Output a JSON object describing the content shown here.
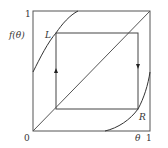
{
  "diagram": {
    "axis_labels": {
      "y_top": "1",
      "y_func": "f(θ)",
      "origin": "0",
      "x_theta": "θ",
      "x_right": "1"
    },
    "points": {
      "L": "L",
      "R": "R"
    },
    "colors": {
      "stroke": "#333333",
      "background": "#ffffff"
    }
  }
}
